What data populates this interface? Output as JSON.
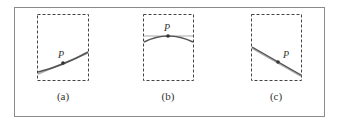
{
  "figure": {
    "panels": [
      {
        "id": "a",
        "caption": "(a)",
        "point_label": "P",
        "description": "curve and tangent line nearly coincide near P (increasing)"
      },
      {
        "id": "b",
        "caption": "(b)",
        "point_label": "P",
        "description": "concave-down curve with horizontal tangent at P"
      },
      {
        "id": "c",
        "caption": "(c)",
        "point_label": "P",
        "description": "curve and tangent line coincide near P (decreasing)"
      }
    ],
    "colors": {
      "frame": "#8a8a8a",
      "dashed_box": "#444444",
      "curve": "#555555",
      "tangent": "#aaaaaa",
      "point": "#333333"
    }
  }
}
